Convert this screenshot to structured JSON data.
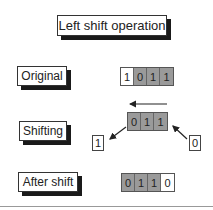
{
  "title": "Left shift operation",
  "rows": [
    {
      "label": "Original",
      "bits": [
        "1",
        "0",
        "1",
        "1"
      ],
      "shaded": [
        false,
        true,
        true,
        true
      ]
    },
    {
      "label": "Shifting",
      "bits": [
        "0",
        "1",
        "1"
      ],
      "shaded": [
        true,
        true,
        true
      ],
      "out_bit": "1",
      "in_bit": "0"
    },
    {
      "label": "After shift",
      "bits": [
        "0",
        "1",
        "1",
        "0"
      ],
      "shaded": [
        true,
        true,
        true,
        false
      ]
    }
  ],
  "colors": {
    "shaded_bit": "#9a9a9a",
    "shadow": "#1a1a1a"
  }
}
